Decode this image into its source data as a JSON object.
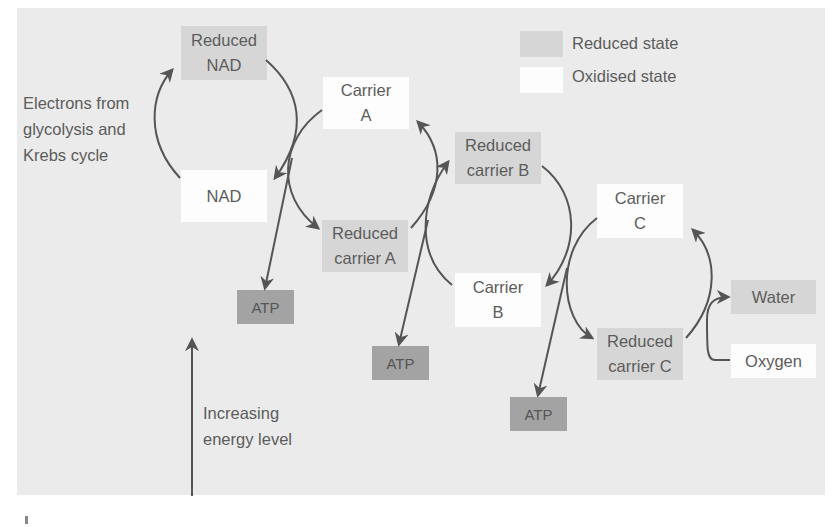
{
  "diagram": {
    "legend": [
      {
        "label": "Reduced state",
        "color": "#d6d6d6"
      },
      {
        "label": "Oxidised state",
        "color": "#fdfdfd"
      }
    ],
    "nodes": {
      "reduced_nad": "Reduced\nNAD",
      "nad": "NAD",
      "carrier_a": "Carrier\nA",
      "reduced_carrier_a": "Reduced\ncarrier A",
      "reduced_carrier_b": "Reduced\ncarrier B",
      "carrier_b": "Carrier\nB",
      "carrier_c": "Carrier\nC",
      "reduced_carrier_c": "Reduced\ncarrier C",
      "water": "Water",
      "oxygen": "Oxygen",
      "atp_1": "ATP",
      "atp_2": "ATP",
      "atp_3": "ATP"
    },
    "annotations": {
      "electrons_source": "Electrons from\nglycolysis and\nKrebs cycle",
      "energy_axis": "Increasing\nenergy level"
    },
    "colors": {
      "background": "#ebebeb",
      "reduced": "#d6d6d6",
      "oxidised": "#fdfdfd",
      "atp": "#a3a3a3",
      "arrow": "#555555",
      "text": "#5c5c5c"
    }
  }
}
